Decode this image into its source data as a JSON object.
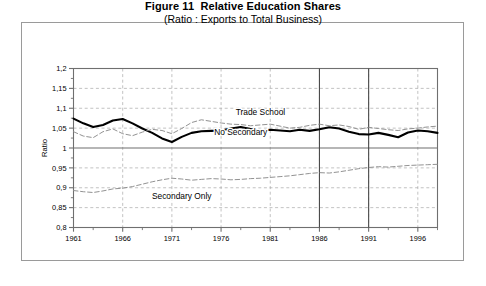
{
  "figure": {
    "title": "Figure 11  Relative Education Shares",
    "subtitle": "(Ratio : Exports to Total Business)"
  },
  "chart_data": {
    "type": "line",
    "title": "Figure 11  Relative Education Shares",
    "subtitle": "(Ratio : Exports to Total Business)",
    "xlabel": "",
    "ylabel": "Ratio",
    "xlim": [
      1961,
      1998
    ],
    "ylim": [
      0.8,
      1.2
    ],
    "ytick_labels": [
      "0,8",
      "0,85",
      "0,9",
      "0,95",
      "1",
      "1,05",
      "1,1",
      "1,15",
      "1,2"
    ],
    "ytick_values": [
      0.8,
      0.85,
      0.9,
      0.95,
      1.0,
      1.05,
      1.1,
      1.15,
      1.2
    ],
    "xtick_labels": [
      "1961",
      "1966",
      "1971",
      "1976",
      "1981",
      "1986",
      "1991",
      "1996"
    ],
    "xtick_values": [
      1961,
      1966,
      1971,
      1976,
      1981,
      1986,
      1991,
      1996
    ],
    "minor_xtick_values": [
      1963,
      1968,
      1973,
      1978,
      1983,
      1988,
      1993,
      1998
    ],
    "minor_ytick_values": [
      0.825,
      0.875,
      0.925,
      0.975,
      1.025,
      1.075,
      1.125,
      1.175
    ],
    "grid": true,
    "grid_style": "dashed",
    "legend_position": "inline-annotations",
    "reference_line_y": 1.0,
    "event_lines_x": [
      1986,
      1991
    ],
    "x": [
      1961,
      1962,
      1963,
      1964,
      1965,
      1966,
      1967,
      1968,
      1969,
      1970,
      1971,
      1972,
      1973,
      1974,
      1975,
      1976,
      1977,
      1978,
      1979,
      1980,
      1981,
      1982,
      1983,
      1984,
      1985,
      1986,
      1987,
      1988,
      1989,
      1990,
      1991,
      1992,
      1993,
      1994,
      1995,
      1996,
      1997,
      1998
    ],
    "series": [
      {
        "name": "No Secondary",
        "style": "solid-bold",
        "label_x": 1978,
        "label_y": 1.032,
        "values": [
          1.074,
          1.062,
          1.053,
          1.058,
          1.069,
          1.073,
          1.062,
          1.049,
          1.038,
          1.024,
          1.015,
          1.028,
          1.038,
          1.042,
          1.043,
          1.044,
          1.049,
          1.053,
          1.048,
          1.043,
          1.046,
          1.044,
          1.042,
          1.046,
          1.043,
          1.047,
          1.052,
          1.049,
          1.041,
          1.035,
          1.034,
          1.038,
          1.033,
          1.027,
          1.039,
          1.044,
          1.042,
          1.038
        ]
      },
      {
        "name": "Trade School",
        "style": "dashed",
        "label_x": 1980,
        "label_y": 1.084,
        "values": [
          1.041,
          1.03,
          1.026,
          1.041,
          1.048,
          1.036,
          1.031,
          1.04,
          1.047,
          1.044,
          1.036,
          1.049,
          1.064,
          1.071,
          1.067,
          1.063,
          1.06,
          1.059,
          1.056,
          1.058,
          1.06,
          1.055,
          1.05,
          1.052,
          1.057,
          1.06,
          1.056,
          1.058,
          1.054,
          1.047,
          1.052,
          1.049,
          1.046,
          1.044,
          1.048,
          1.05,
          1.053,
          1.055
        ]
      },
      {
        "name": "Secondary Only",
        "style": "dashed",
        "label_x": 1972,
        "label_y": 0.872,
        "values": [
          0.893,
          0.89,
          0.888,
          0.892,
          0.897,
          0.899,
          0.903,
          0.909,
          0.915,
          0.92,
          0.924,
          0.922,
          0.919,
          0.921,
          0.923,
          0.922,
          0.92,
          0.921,
          0.923,
          0.924,
          0.926,
          0.928,
          0.93,
          0.933,
          0.936,
          0.938,
          0.937,
          0.94,
          0.944,
          0.948,
          0.951,
          0.953,
          0.952,
          0.954,
          0.956,
          0.957,
          0.958,
          0.959
        ]
      }
    ]
  },
  "colors": {
    "axis": "#6f6f6f",
    "grid": "#a8a8a8",
    "series_bold": "#000000",
    "series_dashed": "#8c8c8c",
    "frame": "#9a9a9a",
    "text": "#000000"
  }
}
